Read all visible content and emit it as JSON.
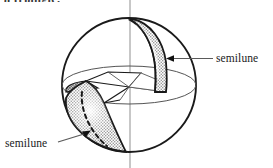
{
  "figure": {
    "title_fragment": "a triangle.",
    "type": "geometric-diagram",
    "background_color": "#ffffff",
    "ink_color": "#1a1a1a",
    "shade_color": "#b9b9b9",
    "dark_shade_color": "#8a8a8a",
    "sphere": {
      "center_x": 129,
      "center_y": 85,
      "radius": 67
    },
    "labels": {
      "right": "semilune",
      "left": "semilune"
    },
    "annotations": {
      "right_leader": "arrow pointing left to upper semilune band",
      "left_leader": "arrow pointing up-right to lower semilune region"
    }
  }
}
